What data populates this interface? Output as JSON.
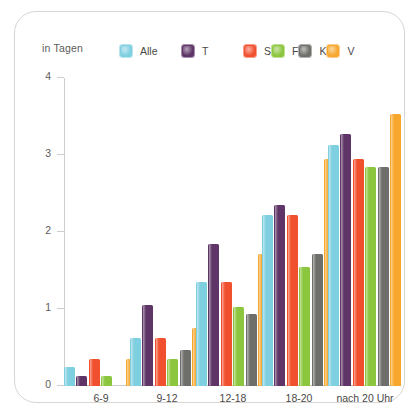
{
  "axis_unit_label": "in Tagen",
  "legend": {
    "entries": [
      {
        "label": "Alle",
        "color": "#7ecfe0",
        "icon": "legend-swatch-alle"
      },
      {
        "label": "T",
        "color": "#5e3566",
        "icon": "legend-swatch-t"
      },
      {
        "label": "S",
        "color": "#f1502f",
        "icon": "legend-swatch-s"
      },
      {
        "label": "F",
        "color": "#8cc63e",
        "icon": "legend-swatch-f"
      },
      {
        "label": "K",
        "color": "#6e6e6b",
        "icon": "legend-swatch-k"
      },
      {
        "label": "V",
        "color": "#f7a72e",
        "icon": "legend-swatch-v"
      }
    ]
  },
  "chart_data": {
    "type": "bar",
    "title": "",
    "subtitle": "",
    "xlabel": "",
    "ylabel": "in Tagen",
    "ylim": [
      0,
      4
    ],
    "yticks": [
      "0",
      "1",
      "2",
      "3",
      "4"
    ],
    "ytick_values": [
      0,
      1,
      2,
      3,
      4
    ],
    "grid": false,
    "legend_position": "top-center",
    "categories": [
      "6-9",
      "9-12",
      "12-18",
      "18-20",
      "nach 20 Uhr"
    ],
    "series": [
      {
        "name": "Alle",
        "color": "#7ecfe0",
        "values": [
          0.25,
          0.63,
          1.35,
          2.22,
          3.13
        ]
      },
      {
        "name": "T",
        "color": "#5e3566",
        "values": [
          0.13,
          1.05,
          1.85,
          2.35,
          3.27
        ]
      },
      {
        "name": "S",
        "color": "#f1502f",
        "values": [
          0.35,
          0.63,
          1.35,
          2.22,
          2.95
        ]
      },
      {
        "name": "F",
        "color": "#8cc63e",
        "values": [
          0.13,
          0.35,
          1.03,
          1.55,
          2.84
        ]
      },
      {
        "name": "K",
        "color": "#6e6e6b",
        "values": [
          0.0,
          0.47,
          0.93,
          1.72,
          2.84
        ]
      },
      {
        "name": "V",
        "color": "#f7a72e",
        "values": [
          0.35,
          0.75,
          1.72,
          2.95,
          3.53
        ]
      }
    ]
  }
}
